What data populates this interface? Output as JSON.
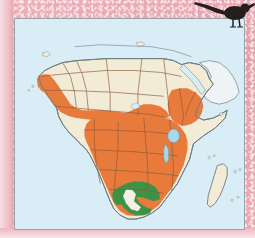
{
  "page": {
    "kind": "field-guide-distribution-map",
    "border_color": "#e9a6b0",
    "page_background": "#ffffff"
  },
  "map": {
    "title": "Africa distribution map",
    "frame": {
      "x": 14,
      "y": 18,
      "width": 231,
      "height": 212,
      "border_color": "#9aa3a8"
    },
    "projection_subject": "Africa, Arabian Peninsula, Madagascar",
    "colors": {
      "ocean": "#d9edf6",
      "land_unshaded": "#f2ebd6",
      "range_primary": "#e87b3c",
      "range_secondary": "#3f9245",
      "country_border": "#8a5a3a",
      "coastline": "#6d7b84",
      "lake": "#a9d6ea"
    },
    "legend": {
      "orange_meaning": "primary distribution range",
      "green_meaning": "secondary distribution range",
      "cream_meaning": "land outside range"
    },
    "regions_shaded_orange": [
      "West African coastal belt",
      "Guinea and Sierra Leone",
      "Nigeria and Cameroon",
      "Congo Basin",
      "Ethiopian Highlands",
      "East African plateau",
      "Angola and Zambia",
      "Zimbabwe and Mozambique",
      "eastern South Africa"
    ],
    "regions_shaded_green": [
      "Botswana",
      "northern South Africa",
      "Zimbabwe border region"
    ],
    "regions_unshaded": [
      "Sahara",
      "Egypt",
      "Libya",
      "Algeria",
      "Horn of Africa",
      "Arabian Peninsula",
      "Madagascar"
    ],
    "water_features": [
      "Lake Victoria",
      "Lake Tanganyika",
      "Red Sea",
      "Mediterranean Sea",
      "Atlantic Ocean",
      "Indian Ocean"
    ],
    "islands": [
      "Madagascar",
      "Comoros",
      "Mascarene islands",
      "Cape Verde",
      "Canary Islands"
    ]
  },
  "bird": {
    "name": "perched bird silhouette",
    "color": "#241f1c",
    "posture": "perched on map frame, head lowered, long tail raised"
  }
}
